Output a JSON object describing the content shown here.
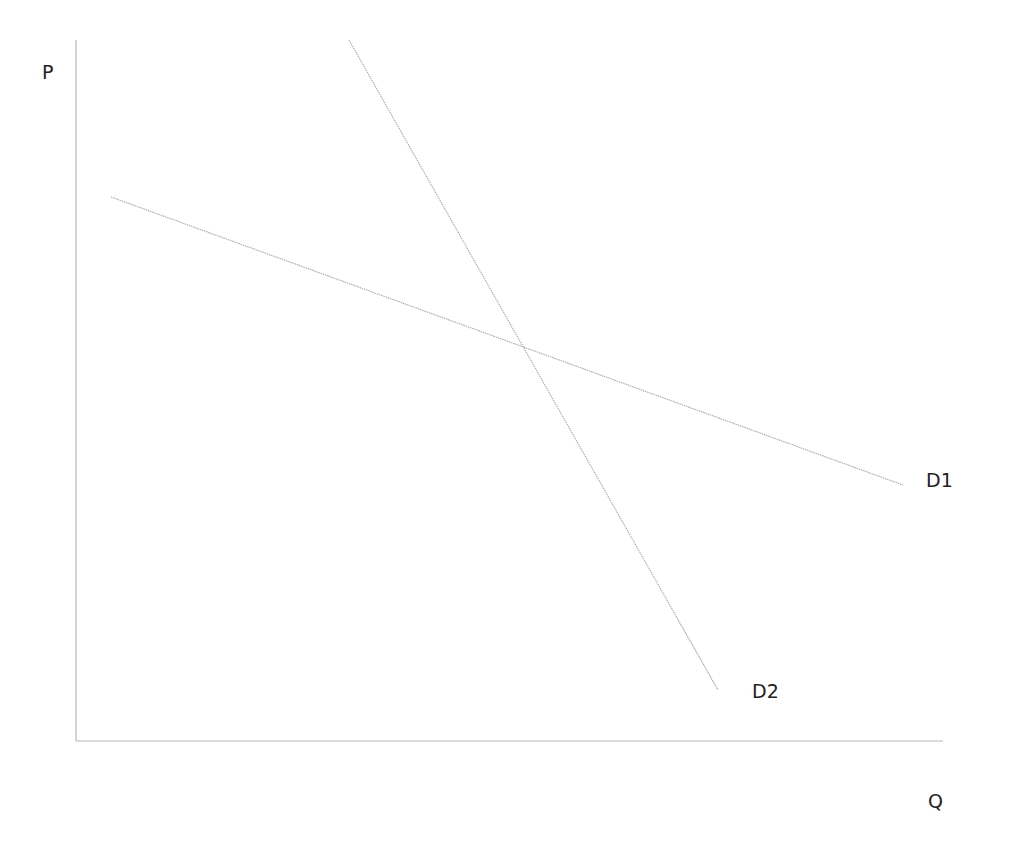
{
  "diagram": {
    "type": "economics-demand-curves",
    "axes": {
      "y_label": "P",
      "x_label": "Q",
      "origin": [
        76,
        741
      ],
      "y_top": [
        76,
        40
      ],
      "x_right": [
        943,
        741
      ]
    },
    "curves": [
      {
        "name": "D1",
        "label": "D1",
        "description": "flatter (more elastic) demand curve",
        "from": [
          111,
          197
        ],
        "to": [
          903,
          485
        ],
        "label_pos": [
          926,
          471
        ]
      },
      {
        "name": "D2",
        "label": "D2",
        "description": "steeper (less elastic) demand curve",
        "from": [
          349,
          40
        ],
        "to": [
          718,
          690
        ],
        "label_pos": [
          752,
          682
        ]
      }
    ],
    "intersection": [
      533,
      366
    ],
    "colors": {
      "background": "#ffffff",
      "axis": "#b8b8b8",
      "curve": "#a9a9a9",
      "text": "#222222"
    }
  }
}
